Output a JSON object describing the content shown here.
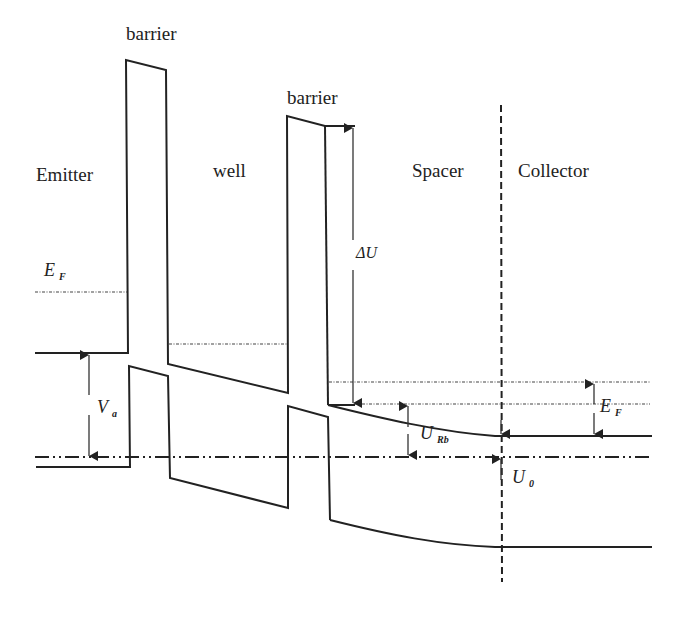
{
  "figure": {
    "regions": {
      "barrier1": "barrier",
      "emitter": "Emitter",
      "well": "well",
      "barrier2": "barrier",
      "spacer": "Spacer",
      "collector": "Collector"
    },
    "symbols": {
      "ef_emitter": {
        "main": "E",
        "sub": "F"
      },
      "delta_u": {
        "main": "ΔU",
        "sub": ""
      },
      "va": {
        "main": "V",
        "sub": "a"
      },
      "urb": {
        "main": "U",
        "sub": "Rb"
      },
      "ef_collector": {
        "main": "E",
        "sub": "F"
      },
      "u0": {
        "main": "U",
        "sub": "0"
      }
    },
    "colors": {
      "line": "#222222",
      "background": "#ffffff"
    }
  }
}
